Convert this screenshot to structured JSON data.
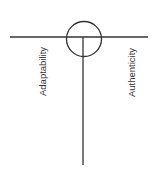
{
  "diagram": {
    "labels": {
      "left": "Adaptability",
      "right": "Authenticity"
    },
    "colors": {
      "stroke": "#333333",
      "text": "#333333"
    }
  }
}
